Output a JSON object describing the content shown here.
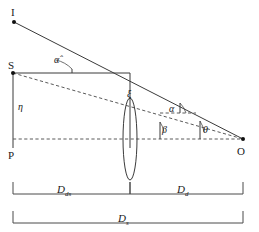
{
  "figure": {
    "kind": "gravitational-lensing-geometry-diagram",
    "points": {
      "image": "I",
      "source": "S",
      "plane_origin": "P",
      "observer": "O"
    },
    "angles": {
      "alpha_hat": "α̂",
      "alpha": "α",
      "beta": "β",
      "theta": "θ"
    },
    "offsets": {
      "eta": "η",
      "xi": "ξ"
    },
    "distances": {
      "d_ds_base": "D",
      "d_ds_sub": "ds",
      "d_d_base": "D",
      "d_d_sub": "d",
      "d_s_base": "D",
      "d_s_sub": "s"
    },
    "colors": {
      "solid_stroke": "#3a3a3a",
      "dashed_stroke": "#5a5a5a",
      "label_fill": "#1a1a1a",
      "background": "#ffffff"
    }
  }
}
